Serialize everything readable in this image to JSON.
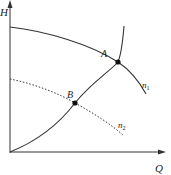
{
  "diagram": {
    "axes": {
      "y_label": "H",
      "x_label": "Q"
    },
    "curves": [
      {
        "id": "n1",
        "label_main": "n",
        "label_sub": "1",
        "style": "solid",
        "description": "pump head curve at speed n1"
      },
      {
        "id": "n2",
        "label_main": "n",
        "label_sub": "2",
        "style": "dotted",
        "description": "pump head curve at speed n2"
      },
      {
        "id": "system",
        "label_main": "",
        "label_sub": "",
        "style": "solid",
        "description": "system (pipeline) curve"
      }
    ],
    "points": [
      {
        "id": "A",
        "label": "A",
        "description": "intersection of n1 curve and system curve"
      },
      {
        "id": "B",
        "label": "B",
        "description": "intersection of n2 curve and system curve"
      }
    ],
    "colors": {
      "line": "#333333",
      "text": "#222222"
    }
  }
}
